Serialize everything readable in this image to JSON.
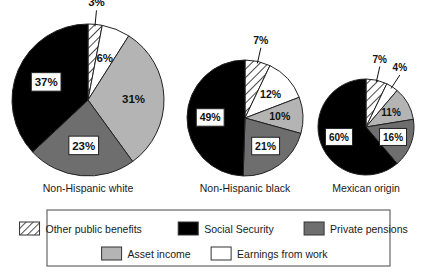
{
  "chart_data": {
    "type": "pie",
    "title": "",
    "subtitle": "",
    "xlabel": "",
    "ylabel": "",
    "grid": false,
    "legend_position": "bottom",
    "units": "percent",
    "note": "Three pie charts showing sources of income share by race/ethnicity group.",
    "categories": [
      "Other public benefits",
      "Social Security",
      "Private pensions",
      "Asset income",
      "Earnings from work"
    ],
    "category_colors": [
      "hatch",
      "#000000",
      "#6e6e6e",
      "#b4b4b4",
      "#ffffff"
    ],
    "slice_order": [
      "Other public benefits",
      "Earnings from work",
      "Asset income",
      "Private pensions",
      "Social Security"
    ],
    "charts": [
      {
        "name": "Non-Hispanic white",
        "label": "Non-Hispanic white",
        "slices": [
          {
            "category": "Other public benefits",
            "value": 3,
            "label": "3%",
            "boxed": false,
            "callout": true
          },
          {
            "category": "Earnings from work",
            "value": 6,
            "label": "6%",
            "boxed": false,
            "callout": false
          },
          {
            "category": "Asset income",
            "value": 31,
            "label": "31%",
            "boxed": false,
            "callout": false
          },
          {
            "category": "Private pensions",
            "value": 23,
            "label": "23%",
            "boxed": true,
            "callout": false
          },
          {
            "category": "Social Security",
            "value": 37,
            "label": "37%",
            "boxed": true,
            "callout": false
          }
        ]
      },
      {
        "name": "Non-Hispanic black",
        "label": "Non-Hispanic black",
        "slices": [
          {
            "category": "Other public benefits",
            "value": 7,
            "label": "7%",
            "boxed": false,
            "callout": true
          },
          {
            "category": "Earnings from work",
            "value": 12,
            "label": "12%",
            "boxed": false,
            "callout": false
          },
          {
            "category": "Asset income",
            "value": 10,
            "label": "10%",
            "boxed": false,
            "callout": false
          },
          {
            "category": "Private pensions",
            "value": 21,
            "label": "21%",
            "boxed": true,
            "callout": false
          },
          {
            "category": "Social Security",
            "value": 49,
            "label": "49%",
            "boxed": true,
            "callout": false
          }
        ]
      },
      {
        "name": "Mexican origin",
        "label": "Mexican origin",
        "slices": [
          {
            "category": "Other public benefits",
            "value": 7,
            "label": "7%",
            "boxed": false,
            "callout": true
          },
          {
            "category": "Earnings from work",
            "value": 4,
            "label": "4%",
            "boxed": false,
            "callout": true
          },
          {
            "category": "Asset income",
            "value": 11,
            "label": "11%",
            "boxed": false,
            "callout": false
          },
          {
            "category": "Private pensions",
            "value": 16,
            "label": "16%",
            "boxed": true,
            "callout": false
          },
          {
            "category": "Social Security",
            "value": 60,
            "label": "60%",
            "boxed": true,
            "callout": false
          }
        ]
      }
    ],
    "legend": {
      "rows": [
        [
          {
            "label": "Other public benefits",
            "swatch": "hatch"
          },
          {
            "label": "Social Security",
            "swatch": "#000000"
          },
          {
            "label": "Private pensions",
            "swatch": "#6e6e6e"
          }
        ],
        [
          {
            "label": "Asset income",
            "swatch": "#b4b4b4"
          },
          {
            "label": "Earnings from work",
            "swatch": "#ffffff"
          }
        ]
      ]
    }
  },
  "layout": {
    "pies": [
      {
        "cx": 88,
        "cy": 100,
        "r": 76,
        "label_y": 192,
        "label_font": 10.5,
        "value_font": 11.5
      },
      {
        "cx": 245,
        "cy": 118,
        "r": 58,
        "label_y": 192,
        "label_font": 10.5,
        "value_font": 10.5
      },
      {
        "cx": 366,
        "cy": 127,
        "r": 48,
        "label_y": 192,
        "label_font": 10.5,
        "value_font": 10
      }
    ],
    "legend_box": {
      "x": 47,
      "y": 210,
      "w": 343,
      "h": 56
    },
    "border_color": "#666666",
    "stroke_color": "#222222"
  }
}
